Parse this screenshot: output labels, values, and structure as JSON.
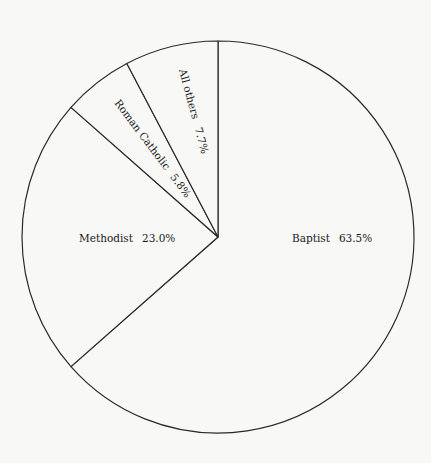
{
  "chart_data": {
    "type": "pie",
    "title": "",
    "start_angle": "top",
    "direction": "clockwise",
    "slices": [
      {
        "label": "Baptist",
        "value": 63.5,
        "display": "63.5%"
      },
      {
        "label": "Methodist",
        "value": 23.0,
        "display": "23.0%"
      },
      {
        "label": "Roman Catholic",
        "value": 5.8,
        "display": "5.8%"
      },
      {
        "label": "All others",
        "value": 7.7,
        "display": "7.7%"
      }
    ],
    "colors": {
      "fill": "#f8f8f7",
      "stroke": "#2a2a2a",
      "text": "#1a1a1a"
    }
  }
}
